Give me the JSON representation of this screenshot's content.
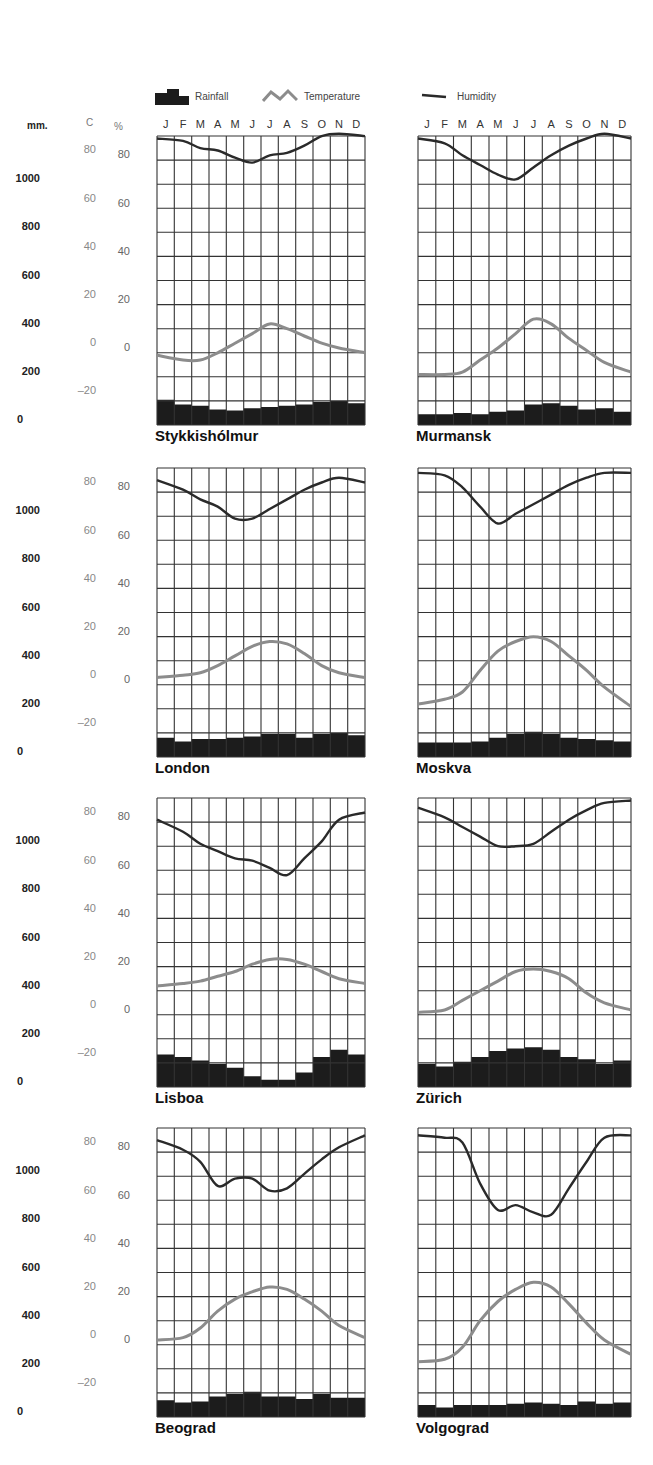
{
  "legend": {
    "rainfall_label": "Rainfall",
    "temperature_label": "Temperature",
    "humidity_label": "Humidity"
  },
  "axes": {
    "rainfall_unit": "mm.",
    "temperature_unit": "C",
    "humidity_unit": "%",
    "rainfall_ticks": [
      "1000",
      "800",
      "600",
      "400",
      "200",
      "0"
    ],
    "temperature_ticks": [
      "80",
      "60",
      "40",
      "20",
      "0",
      "-20"
    ],
    "humidity_ticks": [
      "80",
      "60",
      "40",
      "20",
      "0"
    ]
  },
  "months": [
    "J",
    "F",
    "M",
    "A",
    "M",
    "J",
    "J",
    "A",
    "S",
    "O",
    "N",
    "D"
  ],
  "colors": {
    "rainfall": "#1c1c1c",
    "temperature": "#8c8c8c",
    "humidity": "#2a2a2a",
    "grid": "#333333"
  },
  "chart_data": [
    {
      "type": "line",
      "title": "Stykkishólmur",
      "categories": [
        "J",
        "F",
        "M",
        "A",
        "M",
        "J",
        "J",
        "A",
        "S",
        "O",
        "N",
        "D"
      ],
      "series": [
        {
          "name": "Humidity",
          "unit": "%",
          "values": [
            87,
            86,
            83,
            82,
            79,
            77,
            80,
            81,
            84,
            88,
            89,
            88
          ]
        },
        {
          "name": "Temperature",
          "unit": "C",
          "values": [
            -3,
            -5,
            -5,
            -2,
            2,
            6,
            10,
            8,
            5,
            2,
            0,
            -2
          ]
        },
        {
          "name": "Rainfall",
          "unit": "mm",
          "values": [
            80,
            60,
            55,
            40,
            35,
            45,
            50,
            55,
            60,
            70,
            75,
            65
          ]
        }
      ],
      "ylim_humidity": [
        0,
        90
      ],
      "ylim_temperature": [
        -30,
        90
      ],
      "ylim_rainfall": [
        0,
        1200
      ]
    },
    {
      "type": "line",
      "title": "Murmansk",
      "categories": [
        "J",
        "F",
        "M",
        "A",
        "M",
        "J",
        "J",
        "A",
        "S",
        "O",
        "N",
        "D"
      ],
      "series": [
        {
          "name": "Humidity",
          "unit": "%",
          "values": [
            87,
            85,
            80,
            76,
            72,
            70,
            75,
            80,
            84,
            87,
            89,
            87
          ]
        },
        {
          "name": "Temperature",
          "unit": "C",
          "values": [
            -11,
            -11,
            -10,
            -5,
            0,
            6,
            12,
            10,
            4,
            -1,
            -6,
            -10
          ]
        },
        {
          "name": "Rainfall",
          "unit": "mm",
          "values": [
            20,
            20,
            25,
            20,
            30,
            35,
            60,
            65,
            55,
            40,
            45,
            30
          ]
        }
      ],
      "ylim_humidity": [
        0,
        90
      ],
      "ylim_temperature": [
        -30,
        90
      ],
      "ylim_rainfall": [
        0,
        1200
      ]
    },
    {
      "type": "line",
      "title": "London",
      "categories": [
        "J",
        "F",
        "M",
        "A",
        "M",
        "J",
        "J",
        "A",
        "S",
        "O",
        "N",
        "D"
      ],
      "series": [
        {
          "name": "Humidity",
          "unit": "%",
          "values": [
            83,
            79,
            75,
            72,
            67,
            67,
            71,
            75,
            79,
            82,
            84,
            82
          ]
        },
        {
          "name": "Temperature",
          "unit": "C",
          "values": [
            1,
            2,
            3,
            6,
            10,
            14,
            16,
            15,
            11,
            6,
            3,
            1
          ]
        },
        {
          "name": "Rainfall",
          "unit": "mm",
          "values": [
            55,
            40,
            50,
            50,
            55,
            60,
            70,
            70,
            55,
            70,
            75,
            65
          ]
        }
      ],
      "ylim_humidity": [
        0,
        90
      ],
      "ylim_temperature": [
        -30,
        90
      ],
      "ylim_rainfall": [
        0,
        1200
      ]
    },
    {
      "type": "line",
      "title": "Moskva",
      "categories": [
        "J",
        "F",
        "M",
        "A",
        "M",
        "J",
        "J",
        "A",
        "S",
        "O",
        "N",
        "D"
      ],
      "series": [
        {
          "name": "Humidity",
          "unit": "%",
          "values": [
            86,
            85,
            80,
            72,
            65,
            69,
            73,
            77,
            81,
            84,
            86,
            86
          ]
        },
        {
          "name": "Temperature",
          "unit": "C",
          "values": [
            -10,
            -8,
            -5,
            4,
            12,
            16,
            18,
            16,
            10,
            4,
            -3,
            -11
          ]
        },
        {
          "name": "Rainfall",
          "unit": "mm",
          "values": [
            35,
            35,
            35,
            40,
            55,
            70,
            80,
            70,
            55,
            50,
            45,
            40
          ]
        }
      ],
      "ylim_humidity": [
        0,
        90
      ],
      "ylim_temperature": [
        -30,
        90
      ],
      "ylim_rainfall": [
        0,
        1200
      ]
    },
    {
      "type": "line",
      "title": "Lisboa",
      "categories": [
        "J",
        "F",
        "M",
        "A",
        "M",
        "J",
        "J",
        "A",
        "S",
        "O",
        "N",
        "D"
      ],
      "series": [
        {
          "name": "Humidity",
          "unit": "%",
          "values": [
            79,
            74,
            69,
            66,
            63,
            62,
            59,
            56,
            63,
            70,
            79,
            82
          ]
        },
        {
          "name": "Temperature",
          "unit": "C",
          "values": [
            10,
            11,
            12,
            14,
            16,
            19,
            21,
            21,
            19,
            16,
            13,
            11
          ]
        },
        {
          "name": "Rainfall",
          "unit": "mm",
          "values": [
            110,
            100,
            85,
            70,
            55,
            20,
            5,
            5,
            35,
            100,
            130,
            110
          ]
        }
      ],
      "ylim_humidity": [
        0,
        90
      ],
      "ylim_temperature": [
        -30,
        90
      ],
      "ylim_rainfall": [
        0,
        1200
      ]
    },
    {
      "type": "line",
      "title": "Zürich",
      "categories": [
        "J",
        "F",
        "M",
        "A",
        "M",
        "J",
        "J",
        "A",
        "S",
        "O",
        "N",
        "D"
      ],
      "series": [
        {
          "name": "Humidity",
          "unit": "%",
          "values": [
            84,
            80,
            76,
            72,
            68,
            68,
            69,
            74,
            79,
            83,
            86,
            87
          ]
        },
        {
          "name": "Temperature",
          "unit": "C",
          "values": [
            -1,
            0,
            4,
            8,
            12,
            16,
            17,
            16,
            13,
            7,
            3,
            0
          ]
        },
        {
          "name": "Rainfall",
          "unit": "mm",
          "values": [
            70,
            60,
            80,
            100,
            125,
            135,
            140,
            130,
            100,
            90,
            70,
            85
          ]
        }
      ],
      "ylim_humidity": [
        0,
        90
      ],
      "ylim_temperature": [
        -30,
        90
      ],
      "ylim_rainfall": [
        0,
        1200
      ]
    },
    {
      "type": "line",
      "title": "Beograd",
      "categories": [
        "J",
        "F",
        "M",
        "A",
        "M",
        "J",
        "J",
        "A",
        "S",
        "O",
        "N",
        "D"
      ],
      "series": [
        {
          "name": "Humidity",
          "unit": "%",
          "values": [
            83,
            79,
            74,
            64,
            67,
            67,
            62,
            63,
            69,
            75,
            80,
            85
          ]
        },
        {
          "name": "Temperature",
          "unit": "C",
          "values": [
            0,
            1,
            5,
            12,
            17,
            20,
            22,
            21,
            17,
            12,
            6,
            1
          ]
        },
        {
          "name": "Rainfall",
          "unit": "mm",
          "values": [
            45,
            35,
            40,
            60,
            70,
            80,
            60,
            60,
            50,
            70,
            55,
            55
          ]
        }
      ],
      "ylim_humidity": [
        0,
        90
      ],
      "ylim_temperature": [
        -30,
        90
      ],
      "ylim_rainfall": [
        0,
        1200
      ]
    },
    {
      "type": "line",
      "title": "Volgograd",
      "categories": [
        "J",
        "F",
        "M",
        "A",
        "M",
        "J",
        "J",
        "A",
        "S",
        "O",
        "N",
        "D"
      ],
      "series": [
        {
          "name": "Humidity",
          "unit": "%",
          "values": [
            85,
            84,
            82,
            65,
            54,
            56,
            53,
            52,
            63,
            74,
            84,
            85
          ]
        },
        {
          "name": "Temperature",
          "unit": "C",
          "values": [
            -9,
            -8,
            -3,
            8,
            16,
            21,
            24,
            22,
            15,
            7,
            0,
            -6
          ]
        },
        {
          "name": "Rainfall",
          "unit": "mm",
          "values": [
            25,
            15,
            25,
            25,
            25,
            30,
            35,
            30,
            25,
            40,
            30,
            35
          ]
        }
      ],
      "ylim_humidity": [
        0,
        90
      ],
      "ylim_temperature": [
        -30,
        90
      ],
      "ylim_rainfall": [
        0,
        1200
      ]
    }
  ]
}
